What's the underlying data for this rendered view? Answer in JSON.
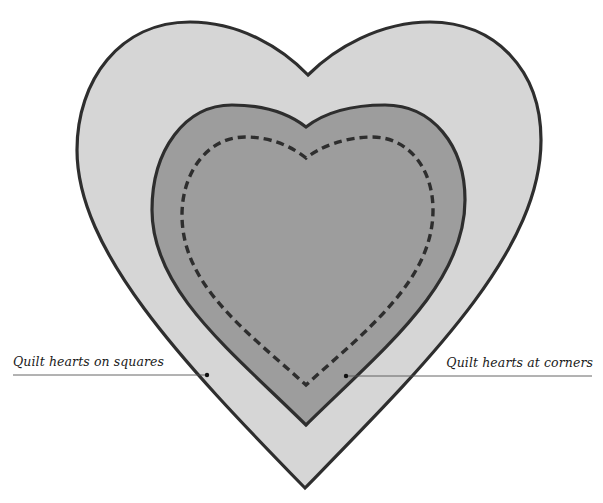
{
  "diagram": {
    "title": "",
    "colors": {
      "outer_heart_fill": "#d6d6d6",
      "inner_heart_fill": "#9d9d9d",
      "outline": "#2e2e2e",
      "stitch_line": "#2e2e2e",
      "leader_line": "#555555",
      "background": "#ffffff"
    },
    "shapes": [
      {
        "name": "outer-heart",
        "description": "Large light gray heart with dark outline"
      },
      {
        "name": "inner-heart",
        "description": "Medium gray heart with dark outline"
      },
      {
        "name": "stitch-heart",
        "description": "Dashed quilting line heart inside inner heart"
      }
    ],
    "annotations": [
      {
        "text": "Quilt hearts on squares",
        "side": "left",
        "points_to": "outer-heart"
      },
      {
        "text": "Quilt hearts at corners",
        "side": "right",
        "points_to": "inner-heart"
      }
    ]
  }
}
